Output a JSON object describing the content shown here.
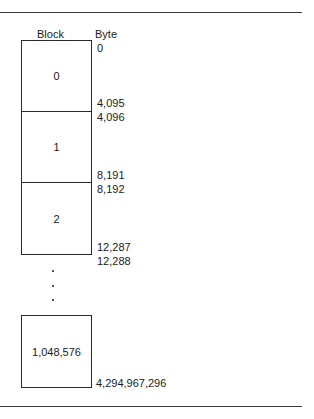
{
  "headers": {
    "block": "Block",
    "byte": "Byte"
  },
  "blocks": [
    {
      "label": "0",
      "start_byte": "0",
      "end_byte": "4,095"
    },
    {
      "label": "1",
      "start_byte": "4,096",
      "end_byte": "8,191"
    },
    {
      "label": "2",
      "start_byte": "8,192",
      "end_byte": "12,287"
    },
    {
      "label": "1,048,576",
      "start_byte": "",
      "end_byte": "4,294,967,296"
    }
  ],
  "continuation": {
    "start_byte": "12,288",
    "ellipsis": "⋮"
  }
}
